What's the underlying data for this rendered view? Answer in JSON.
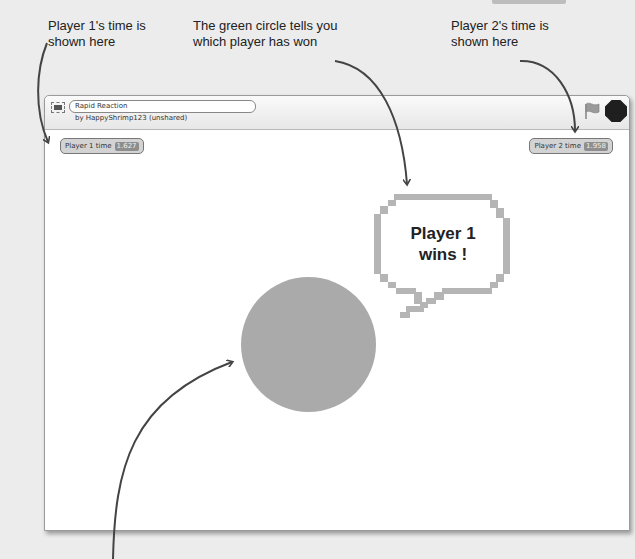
{
  "annotations": {
    "player1_time": [
      "Player 1's time is",
      "shown here"
    ],
    "winner_circle": [
      "The green circle tells you",
      "which player has won"
    ],
    "player2_time": [
      "Player 2's time is",
      "shown here"
    ]
  },
  "stage": {
    "project_title": "Rapid Reaction",
    "author": "by HappyShrimp123 (unshared)",
    "controls": {
      "fullscreen": "fullscreen-icon",
      "green_flag": "green-flag-icon",
      "stop": "stop-icon"
    }
  },
  "monitors": {
    "player1": {
      "label": "Player 1 time",
      "value": "1.627"
    },
    "player2": {
      "label": "Player 2 time",
      "value": "1.958"
    }
  },
  "speech_bubble": {
    "lines": [
      "Player 1",
      "wins !"
    ]
  },
  "colors": {
    "background": "#ececec",
    "stage": "#ffffff",
    "circle": "#aaaaaa",
    "bubble_outline": "#b5b5b5",
    "monitor_bg": "#d3d3d3",
    "monitor_value_bg": "#8e8e8e",
    "arrow": "#444444"
  }
}
